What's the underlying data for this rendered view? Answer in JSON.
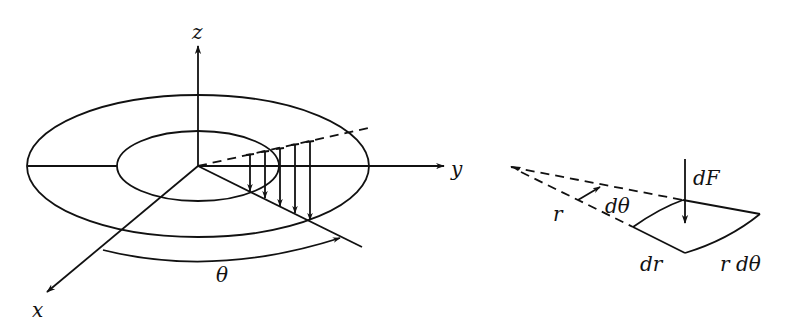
{
  "left_figure": {
    "axes": {
      "z_label": "z",
      "y_label": "y",
      "x_label": "x"
    },
    "angle_label": "θ",
    "description": "Annular disk in xyz frame with distributed downward load arrows along a radial line at angle θ"
  },
  "right_figure": {
    "labels": {
      "force": "dF",
      "radius": "r",
      "angle": "dθ",
      "radial_width": "dr",
      "arc_length": "r dθ"
    },
    "description": "Differential element of area dr by r dθ with force dF acting downward"
  },
  "colors": {
    "stroke": "#111111",
    "background": "#ffffff"
  }
}
